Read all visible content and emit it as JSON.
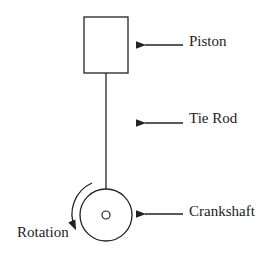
{
  "labels": {
    "piston": "Piston",
    "tie_rod": "Tie Rod",
    "crankshaft": "Crankshaft",
    "rotation": "Rotation"
  },
  "colors": {
    "stroke": "#222222",
    "background": "#ffffff"
  }
}
